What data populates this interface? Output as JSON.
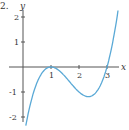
{
  "problem_number": "2.",
  "chart_data": {
    "type": "line",
    "title": "",
    "xlabel": "x",
    "ylabel": "y",
    "x_ticks": [
      "1",
      "2",
      "3"
    ],
    "y_ticks": [
      "2",
      "1",
      "-1",
      "-2"
    ],
    "xlim": [
      0,
      3.5
    ],
    "ylim": [
      -2.2,
      2.3
    ],
    "grid": false,
    "series": [
      {
        "name": "curve",
        "color": "#5aa9d6",
        "x": [
          0.1,
          0.25,
          0.5,
          0.75,
          1.0,
          1.25,
          1.5,
          1.75,
          2.0,
          2.33,
          2.5,
          2.75,
          3.0,
          3.25,
          3.45
        ],
        "y": [
          -2.35,
          -1.55,
          -0.63,
          -0.14,
          0.0,
          -0.11,
          -0.38,
          -0.7,
          -1.0,
          -1.19,
          -1.13,
          -0.77,
          0.0,
          1.27,
          2.3
        ]
      }
    ],
    "key_points": {
      "local_max": [
        1,
        0
      ],
      "local_min": [
        2.33,
        -1.19
      ],
      "x_intercepts": [
        1,
        3
      ]
    }
  }
}
